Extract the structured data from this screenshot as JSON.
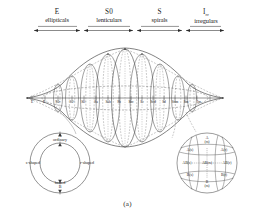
{
  "figure": {
    "caption": "(a)",
    "title_hidden": "de Vaucouleurs classification volume"
  },
  "header": {
    "classes": [
      {
        "code": "E",
        "code_sub": "",
        "name": "ellipticals"
      },
      {
        "code": "S0",
        "code_sub": "",
        "name": "lenticulars"
      },
      {
        "code": "S",
        "code_sub": "",
        "name": "spirals"
      },
      {
        "code": "I",
        "code_sub": "rr",
        "name": "irregulars"
      }
    ]
  },
  "axis": {
    "name": "hubble-stage-axis",
    "ticks": [
      "E",
      "E+",
      "S0-",
      "S0°",
      "S0+",
      "Sa",
      "Sab",
      "Sb",
      "Sbc",
      "Sc",
      "Scd",
      "Sd",
      "Sdm",
      "Sm",
      "Im"
    ]
  },
  "left_inset": {
    "name": "family-variety-ring",
    "top": {
      "code": "A",
      "label": "ordinary"
    },
    "bottom": {
      "code": "B",
      "label": "barred"
    },
    "left": {
      "label": "s-shaped"
    },
    "right": {
      "label": "r-shaped"
    }
  },
  "right_inset": {
    "name": "classification-cross-section",
    "poles": {
      "top": "A",
      "top_sub": "(rs)",
      "bottom": "B",
      "bottom_sub": "(rs)"
    },
    "cells": [
      {
        "label": "A(s)",
        "row": 0,
        "col": 0
      },
      {
        "label": "A",
        "label2": "(rs)",
        "row": 0,
        "col": 1
      },
      {
        "label": "A(r)",
        "row": 0,
        "col": 2
      },
      {
        "label": "AB(s)",
        "row": 1,
        "col": 0
      },
      {
        "label": "AB(rs)",
        "row": 1,
        "col": 1
      },
      {
        "label": "AB(r)",
        "row": 1,
        "col": 2
      },
      {
        "label": "B(s)",
        "row": 2,
        "col": 0
      },
      {
        "label": "B",
        "label2": "(rs)",
        "row": 2,
        "col": 1
      },
      {
        "label": "B(r)",
        "row": 2,
        "col": 2
      }
    ]
  },
  "colors": {
    "ink": "#1a1a1a",
    "line": "#3a3a3a",
    "dashed": "#6a6a6a",
    "background": "#ffffff"
  }
}
